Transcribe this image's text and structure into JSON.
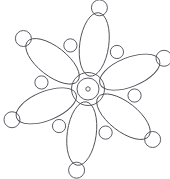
{
  "canvas": {
    "width": 170,
    "height": 179,
    "background_color": "#ffffff",
    "title": "Six-petal rosette geometric line figure"
  },
  "style": {
    "stroke_color": "#4a4a52",
    "stroke_color_light": "#6b6b73",
    "stroke_width": 0.9,
    "fill": "none"
  },
  "chart_data": {
    "type": "diagram",
    "title": "Six-petal rosette geometric line figure",
    "subtitle": "",
    "xlabel": "",
    "ylabel": "",
    "symmetry": {
      "order": 6,
      "angle_step_deg": 60,
      "start_angle_deg": -82,
      "center_x": 88,
      "center_y": 89
    },
    "center_rings": [
      {
        "name": "outer-ring",
        "radius": 16.5
      },
      {
        "name": "middle-ring",
        "radius": 11.0
      },
      {
        "name": "inner-dot",
        "radius": 2.2
      }
    ],
    "petals": {
      "count": 6,
      "shape": "ellipse",
      "semi_major": 32,
      "semi_minor": 14.5,
      "center_distance": 45,
      "angles_deg": [
        -82,
        -22,
        38,
        98,
        158,
        218
      ]
    },
    "tip_circles": {
      "count": 6,
      "radius": 8.0,
      "center_distance": 82,
      "angles_deg": [
        -82,
        -22,
        38,
        98,
        158,
        218
      ]
    },
    "valley_circles": {
      "count": 6,
      "radius": 6.6,
      "center_distance": 47,
      "angles_deg": [
        -52,
        8,
        68,
        128,
        188,
        248
      ]
    },
    "legend": [],
    "annotations": [],
    "grid": false
  }
}
